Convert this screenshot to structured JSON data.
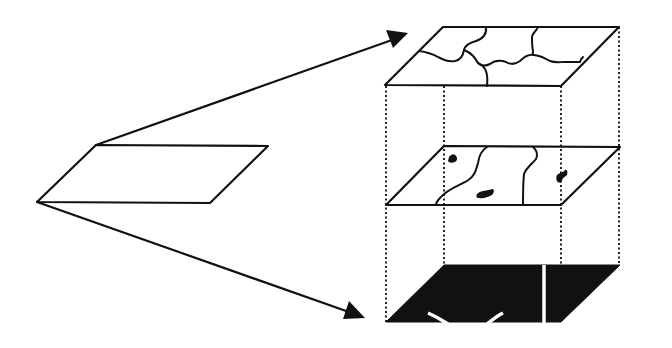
{
  "diagram": {
    "title": "",
    "colors": {
      "ink": "#111111",
      "background": "#ffffff"
    },
    "source_plane": {
      "label": "",
      "points": [
        [
          37,
          202
        ],
        [
          96,
          145
        ],
        [
          268,
          146
        ],
        [
          210,
          203
        ]
      ]
    },
    "arrows": [
      {
        "name": "arrow-to-top-layer",
        "from": [
          96,
          145
        ],
        "to": [
          407,
          34
        ]
      },
      {
        "name": "arrow-to-bottom-layer",
        "from": [
          37,
          202
        ],
        "to": [
          364,
          317
        ]
      }
    ],
    "layers": [
      {
        "name": "top-layer",
        "type": "polygon boundaries",
        "points": [
          [
            385,
            85
          ],
          [
            443,
            27
          ],
          [
            619,
            27
          ],
          [
            561,
            86
          ]
        ]
      },
      {
        "name": "middle-layer",
        "type": "lines with patches",
        "points": [
          [
            386,
            205
          ],
          [
            444,
            146
          ],
          [
            620,
            147
          ],
          [
            561,
            205
          ]
        ]
      },
      {
        "name": "bottom-layer",
        "type": "filled raster",
        "points": [
          [
            386,
            322
          ],
          [
            444,
            265
          ],
          [
            620,
            265
          ],
          [
            561,
            322
          ]
        ]
      }
    ],
    "connectors": {
      "style": "dotted",
      "x_positions": [
        386,
        444,
        561,
        619
      ]
    }
  }
}
